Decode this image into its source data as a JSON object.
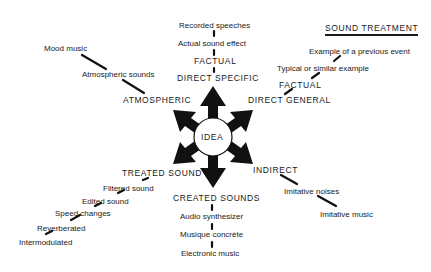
{
  "title": "SOUND TREATMENT",
  "center": "IDEA",
  "branches": {
    "direct_specific": {
      "label": "DIRECT SPECIFIC",
      "sub": "FACTUAL",
      "items": [
        "Actual sound effect",
        "Recorded speeches"
      ]
    },
    "direct_general": {
      "label": "DIRECT GENERAL",
      "sub": "FACTUAL",
      "items": [
        "Typical or similar example",
        "Example of a previous event"
      ]
    },
    "atmospheric": {
      "label": "ATMOSPHERIC",
      "items": [
        "Atmospheric sounds",
        "Mood music"
      ]
    },
    "treated_sound": {
      "label": "TREATED SOUND",
      "items": [
        "Filtered sound",
        "Edited sound",
        "Speed changes",
        "Reverberated",
        "Intermodulated"
      ]
    },
    "created_sounds": {
      "label": "CREATED SOUNDS",
      "items": [
        "Audio synthesizer",
        "Musique concrète",
        "Electronic music"
      ]
    },
    "indirect": {
      "label": "INDIRECT",
      "items": [
        "Imitative noises",
        "Imitative music"
      ]
    }
  }
}
